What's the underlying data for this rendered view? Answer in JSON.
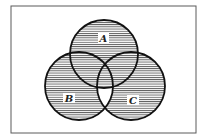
{
  "diagram": {
    "type": "venn",
    "universe_frame": {
      "x": 11,
      "y": 6,
      "width": 185,
      "height": 127,
      "stroke": "#555555"
    },
    "sets": [
      {
        "label": "A",
        "cx": 104,
        "cy": 54,
        "r": 34,
        "label_x": 103,
        "label_y": 41
      },
      {
        "label": "B",
        "cx": 79,
        "cy": 86,
        "r": 34,
        "label_x": 69,
        "label_y": 101
      },
      {
        "label": "C",
        "cx": 131,
        "cy": 86,
        "r": 34,
        "label_x": 133,
        "label_y": 103
      }
    ],
    "shading": {
      "style": "horizontal-hatch",
      "color": "#444444",
      "shaded_regions": [
        "A only",
        "B only",
        "C only",
        "A∩B only",
        "A∩C only",
        "A∩B∩C"
      ],
      "unshaded_regions": [
        "B∩C only",
        "outside all sets"
      ]
    },
    "stroke_color": "#111111"
  }
}
